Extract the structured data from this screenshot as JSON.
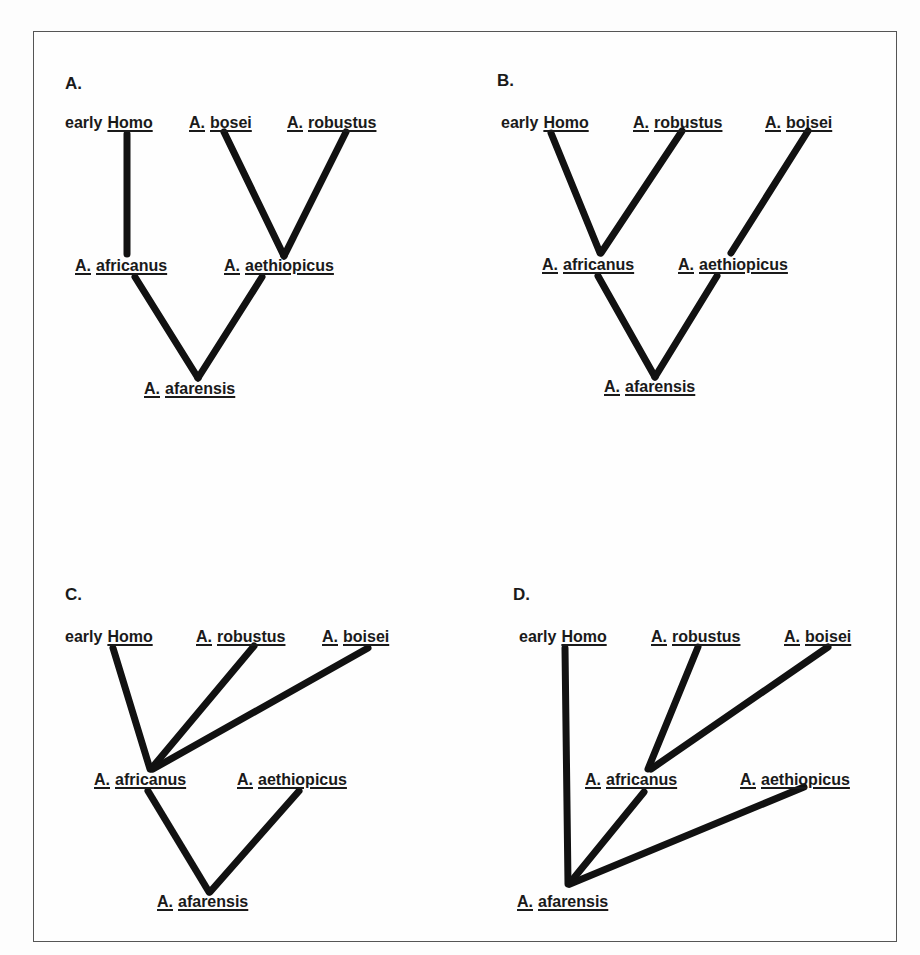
{
  "figure": {
    "panels": [
      {
        "id": "A",
        "letter": "A.",
        "labels": {
          "homo_prefix": "early",
          "homo": "Homo",
          "top2_genus": "A.",
          "top2_species": "bosei",
          "top3_genus": "A.",
          "top3_species": "robustus",
          "mid1_genus": "A.",
          "mid1_species": "africanus",
          "mid2_genus": "A.",
          "mid2_species": "aethiopicus",
          "root_genus": "A.",
          "root_species": "afarensis"
        },
        "branches": [
          [
            "early Homo",
            "A. africanus"
          ],
          [
            "A. bosei",
            "A. aethiopicus"
          ],
          [
            "A. robustus",
            "A. aethiopicus"
          ],
          [
            "A. africanus",
            "A. afarensis"
          ],
          [
            "A. aethiopicus",
            "A. afarensis"
          ]
        ]
      },
      {
        "id": "B",
        "letter": "B.",
        "labels": {
          "homo_prefix": "early",
          "homo": "Homo",
          "top2_genus": "A.",
          "top2_species": "robustus",
          "top3_genus": "A.",
          "top3_species": "boisei",
          "mid1_genus": "A.",
          "mid1_species": "africanus",
          "mid2_genus": "A.",
          "mid2_species": "aethiopicus",
          "root_genus": "A.",
          "root_species": "afarensis"
        },
        "branches": [
          [
            "early Homo",
            "A. africanus"
          ],
          [
            "A. robustus",
            "A. africanus"
          ],
          [
            "A. boisei",
            "A. aethiopicus"
          ],
          [
            "A. africanus",
            "A. afarensis"
          ],
          [
            "A. aethiopicus",
            "A. afarensis"
          ]
        ]
      },
      {
        "id": "C",
        "letter": "C.",
        "labels": {
          "homo_prefix": "early",
          "homo": "Homo",
          "top2_genus": "A.",
          "top2_species": "robustus",
          "top3_genus": "A.",
          "top3_species": "boisei",
          "mid1_genus": "A.",
          "mid1_species": "africanus",
          "mid2_genus": "A.",
          "mid2_species": "aethiopicus",
          "root_genus": "A.",
          "root_species": "afarensis"
        },
        "branches": [
          [
            "early Homo",
            "A. africanus"
          ],
          [
            "A. robustus",
            "A. africanus"
          ],
          [
            "A. boisei",
            "A. africanus"
          ],
          [
            "A. africanus",
            "A. afarensis"
          ],
          [
            "A. aethiopicus",
            "A. afarensis"
          ]
        ]
      },
      {
        "id": "D",
        "letter": "D.",
        "labels": {
          "homo_prefix": "early",
          "homo": "Homo",
          "top2_genus": "A.",
          "top2_species": "robustus",
          "top3_genus": "A.",
          "top3_species": "boisei",
          "mid1_genus": "A.",
          "mid1_species": "africanus",
          "mid2_genus": "A.",
          "mid2_species": "aethiopicus",
          "root_genus": "A.",
          "root_species": "afarensis"
        },
        "branches": [
          [
            "early Homo",
            "A. afarensis"
          ],
          [
            "A. robustus",
            "A. africanus"
          ],
          [
            "A. boisei",
            "A. africanus"
          ],
          [
            "A. africanus",
            "A. afarensis"
          ],
          [
            "A. aethiopicus",
            "A. afarensis"
          ]
        ]
      }
    ],
    "colors": {
      "line": "#111111",
      "text": "#1a1a1a",
      "border": "#555555",
      "background": "#fefefe"
    }
  }
}
